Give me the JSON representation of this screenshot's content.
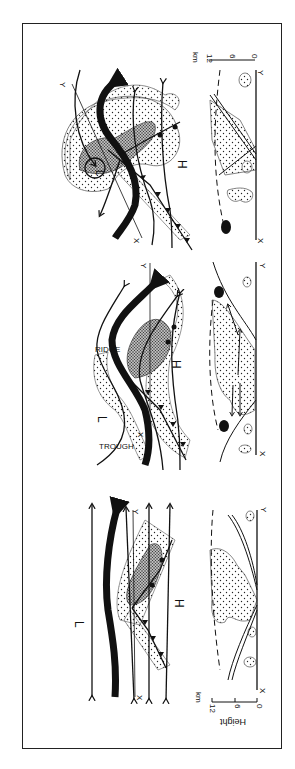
{
  "figure": {
    "type": "synoptic-diagram",
    "panels": [
      {
        "id": "stage-1",
        "plan_labels": {
          "low": "L",
          "high": "H",
          "section_start": "X",
          "section_end": "Y"
        },
        "section_labels": {
          "start": "X",
          "end": "Y"
        },
        "height_axis": {
          "title": "Height",
          "unit": "km",
          "ticks": [
            "0",
            "6",
            "12"
          ]
        }
      },
      {
        "id": "stage-2",
        "plan_labels": {
          "low": "L",
          "high": "H",
          "ridge": "RIDGE",
          "trough": "TROUGH",
          "section_start": "X",
          "section_end": "Y"
        },
        "section_labels": {
          "start": "X",
          "end": "Y"
        }
      },
      {
        "id": "stage-3",
        "plan_labels": {
          "low": "L",
          "high": "H",
          "section_start": "X",
          "section_end": "Y"
        },
        "section_labels": {
          "start": "X",
          "end": "Y"
        },
        "height_axis": {
          "unit": "km",
          "ticks": [
            "0",
            "6",
            "12"
          ]
        }
      }
    ],
    "colors": {
      "ink": "#111111",
      "paper": "#ffffff"
    }
  }
}
